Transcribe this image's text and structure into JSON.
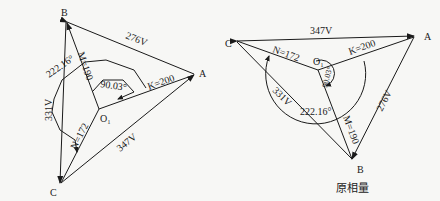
{
  "left_diagram": {
    "vertices": {
      "A": "A",
      "B": "B",
      "C": "C",
      "O": "O₁"
    },
    "line_voltages": {
      "AB": "276V",
      "BC": "331V",
      "CA": "347V"
    },
    "phase_values": {
      "K": "K=200",
      "M": "M=190",
      "N": "N=172"
    },
    "angles": {
      "small": "90.03°",
      "large": "222.16°"
    }
  },
  "right_diagram": {
    "vertices": {
      "A": "A",
      "B": "B",
      "C": "C",
      "O": "O₁"
    },
    "line_voltages": {
      "CA": "347V",
      "AB": "276V",
      "CB": "331V"
    },
    "phase_values": {
      "K": "K=200",
      "M": "M=190",
      "N": "N=172"
    },
    "angles": {
      "small": "90.03°",
      "large": "222.16°"
    },
    "caption": "原相量"
  }
}
